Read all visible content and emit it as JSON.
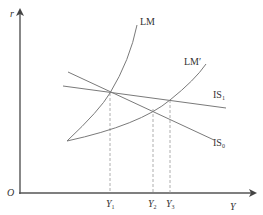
{
  "diagram": {
    "type": "IS-LM model",
    "axes": {
      "y_label": "r",
      "x_label": "Y",
      "origin_label": "O"
    },
    "curves": {
      "lm": {
        "label": "LM"
      },
      "lm_prime": {
        "label": "LM′"
      },
      "is1": {
        "label": "IS",
        "sub": "1"
      },
      "is0": {
        "label": "IS",
        "sub": "0"
      }
    },
    "x_ticks": [
      {
        "label": "Y",
        "sub": "1"
      },
      {
        "label": "Y",
        "sub": "2"
      },
      {
        "label": "Y",
        "sub": "3"
      }
    ],
    "colors": {
      "axis": "#555555",
      "curve": "#7a7a7a",
      "dashed": "#9a9a9a",
      "text": "#333333"
    }
  }
}
